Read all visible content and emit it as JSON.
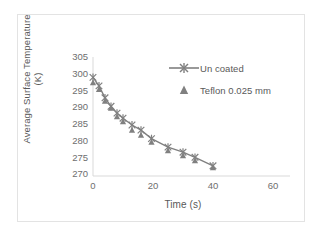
{
  "chart_data": {
    "type": "scatter",
    "title": "",
    "xlabel": "Time (s)",
    "ylabel": "Average Surface Temperature (K)",
    "ylabel_line1": "Average Surface Temperature",
    "ylabel_line2": "(K)",
    "xlim": [
      0,
      60
    ],
    "ylim": [
      270,
      305
    ],
    "xticks": [
      0,
      20,
      40,
      60
    ],
    "yticks": [
      270,
      275,
      280,
      285,
      290,
      295,
      300,
      305
    ],
    "grid": false,
    "legend_position": "upper right",
    "series_color": "#808080",
    "series": [
      {
        "name": "Un coated",
        "marker": "asterisk-cross",
        "line": true,
        "x": [
          0,
          2,
          4,
          6,
          8,
          10,
          13,
          16,
          19.5,
          25,
          30,
          34,
          40
        ],
        "values": [
          299.0,
          296.5,
          293.0,
          290.5,
          288.5,
          287.0,
          285.0,
          283.5,
          281.0,
          278.5,
          277.0,
          275.5,
          273.0
        ]
      },
      {
        "name": "Teflon 0.025 mm",
        "marker": "triangle",
        "line": false,
        "x": [
          0,
          2,
          4,
          6,
          8,
          10,
          13,
          16,
          19.5,
          25,
          30,
          34,
          40
        ],
        "values": [
          297.5,
          295.5,
          292.0,
          290.0,
          287.5,
          286.0,
          283.5,
          282.0,
          280.0,
          277.5,
          276.0,
          274.5,
          272.5
        ]
      }
    ]
  },
  "legend": {
    "items": [
      {
        "label": "Un coated",
        "marker": "asterisk-cross",
        "has_line": true
      },
      {
        "label": "Teflon 0.025 mm",
        "marker": "triangle",
        "has_line": false
      }
    ]
  },
  "axes": {
    "x_tick_labels": [
      "0",
      "20",
      "40",
      "60"
    ],
    "y_tick_labels": [
      "305",
      "300",
      "295",
      "290",
      "285",
      "280",
      "275",
      "270"
    ]
  },
  "colors": {
    "series": "#808080",
    "axis_line": "#d9d9d9",
    "tick_text": "#6e6e6e",
    "title_text": "#595959",
    "frame_border": "#e3e3e3",
    "background": "#ffffff"
  }
}
